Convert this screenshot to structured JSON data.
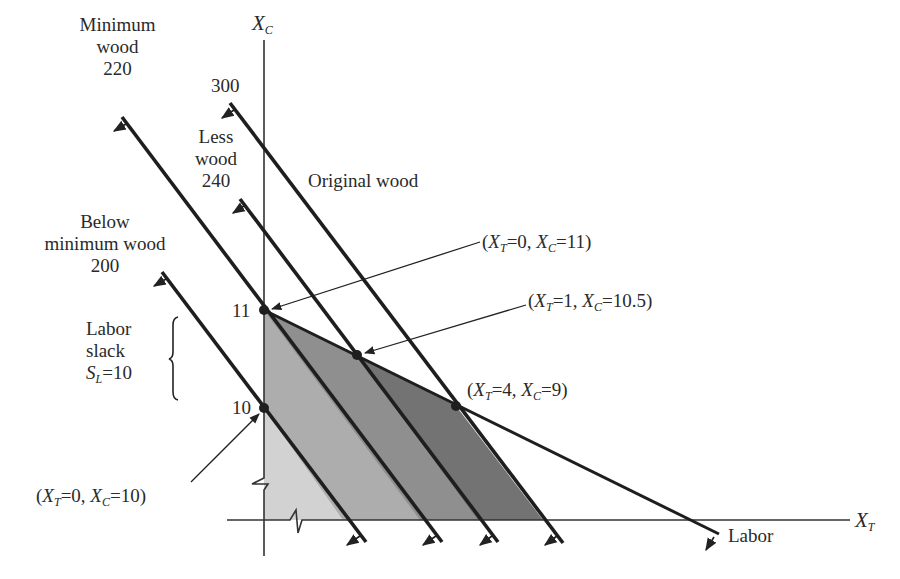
{
  "diagram": {
    "axes": {
      "x": {
        "label": "X",
        "sub": "T"
      },
      "y": {
        "label": "X",
        "sub": "C"
      }
    },
    "ticks": {
      "y_11": "11",
      "y_10": "10"
    },
    "constraints": [
      {
        "id": "wood_300",
        "name_lines": [
          "300"
        ],
        "value": "300",
        "label": "Original wood"
      },
      {
        "id": "wood_240",
        "name_lines": [
          "Less",
          "wood",
          "240"
        ],
        "value": "240"
      },
      {
        "id": "wood_220",
        "name_lines": [
          "Minimum",
          "wood",
          "220"
        ],
        "value": "220"
      },
      {
        "id": "wood_200",
        "name_lines": [
          "Below",
          "minimum wood",
          "200"
        ],
        "value": "200"
      },
      {
        "id": "labor",
        "label": "Labor"
      }
    ],
    "annotations": {
      "p_0_11": {
        "xt": "0",
        "xc": "11"
      },
      "p_1_10_5": {
        "xt": "1",
        "xc": "10.5"
      },
      "p_4_9": {
        "xt": "4",
        "xc": "9"
      },
      "p_0_10": {
        "xt": "0",
        "xc": "10"
      },
      "labor_slack": {
        "line1": "Labor",
        "line2": "slack",
        "var": "S",
        "sub": "L",
        "value": "=10"
      }
    },
    "colors": {
      "region_below_min": "#d2d2d2",
      "region_min": "#adadad",
      "region_less": "#8f8f8f",
      "region_original": "#737373",
      "line": "#1e1e1e"
    }
  }
}
